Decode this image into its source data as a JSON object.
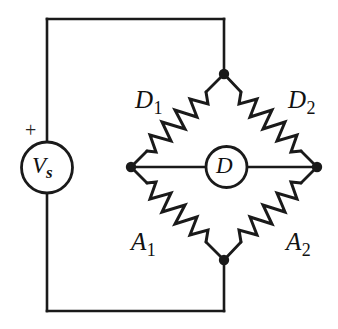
{
  "diagram": {
    "type": "electrical-schematic",
    "line_color": "#1a1a1a",
    "background_color": "#ffffff"
  },
  "source": {
    "symbol": "circle",
    "label": "V",
    "label_subscript": "s",
    "polarity_marker": "+"
  },
  "detector": {
    "symbol": "circle",
    "label": "D"
  },
  "resistors": [
    {
      "id": "d1",
      "label": "D",
      "subscript": "1",
      "arm": "top-left"
    },
    {
      "id": "d2",
      "label": "D",
      "subscript": "2",
      "arm": "top-right"
    },
    {
      "id": "a1",
      "label": "A",
      "subscript": "1",
      "arm": "bottom-left"
    },
    {
      "id": "a2",
      "label": "A",
      "subscript": "2",
      "arm": "bottom-right"
    }
  ],
  "nodes": [
    {
      "id": "top",
      "x": 224,
      "y": 74
    },
    {
      "id": "left",
      "x": 131,
      "y": 167
    },
    {
      "id": "right",
      "x": 317,
      "y": 167
    },
    {
      "id": "bottom",
      "x": 224,
      "y": 260
    }
  ]
}
